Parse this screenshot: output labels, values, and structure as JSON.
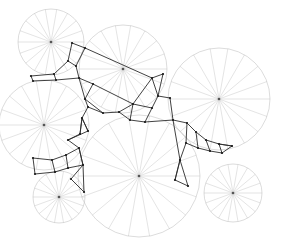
{
  "figure": {
    "width": 281,
    "height": 241,
    "background_color": "#ffffff",
    "circle_stroke_color": "#b9b9b9",
    "spoke_stroke_color": "#c2c2c2",
    "mesh_stroke_color": "#2b2b2b",
    "center_dot_color": "#555555",
    "spokes_per_circle": 18,
    "spoke_angle_step_degrees": 20
  },
  "chart_data": {
    "type": "scatter",
    "xlabel": "",
    "ylabel": "",
    "xlim": [
      0,
      281
    ],
    "ylim": [
      0,
      241
    ],
    "grid": false,
    "legend": "none",
    "circles": [
      {
        "name": "circle-top-left",
        "cx": 51,
        "cy": 42,
        "r": 33,
        "spokes": 18
      },
      {
        "name": "circle-top-middle",
        "cx": 123,
        "cy": 69,
        "r": 44,
        "spokes": 18
      },
      {
        "name": "circle-right",
        "cx": 219,
        "cy": 99,
        "r": 51,
        "spokes": 18
      },
      {
        "name": "circle-left",
        "cx": 44,
        "cy": 125,
        "r": 45,
        "spokes": 18
      },
      {
        "name": "circle-center-bottom",
        "cx": 139,
        "cy": 176,
        "r": 61,
        "spokes": 18
      },
      {
        "name": "circle-bottom-left",
        "cx": 59,
        "cy": 197,
        "r": 26,
        "spokes": 18
      },
      {
        "name": "circle-bottom-right",
        "cx": 233,
        "cy": 193,
        "r": 29,
        "spokes": 18
      }
    ],
    "mesh_nodes": [
      {
        "id": 0,
        "x": 31,
        "y": 76
      },
      {
        "id": 1,
        "x": 54,
        "y": 74
      },
      {
        "id": 2,
        "x": 33,
        "y": 81
      },
      {
        "id": 3,
        "x": 56,
        "y": 80
      },
      {
        "id": 4,
        "x": 72,
        "y": 43
      },
      {
        "id": 5,
        "x": 85,
        "y": 48
      },
      {
        "id": 6,
        "x": 76,
        "y": 66
      },
      {
        "id": 7,
        "x": 68,
        "y": 61
      },
      {
        "id": 8,
        "x": 79,
        "y": 78
      },
      {
        "id": 9,
        "x": 93,
        "y": 84
      },
      {
        "id": 10,
        "x": 85,
        "y": 99
      },
      {
        "id": 11,
        "x": 88,
        "y": 107
      },
      {
        "id": 12,
        "x": 82,
        "y": 118
      },
      {
        "id": 13,
        "x": 88,
        "y": 131
      },
      {
        "id": 14,
        "x": 103,
        "y": 113
      },
      {
        "id": 15,
        "x": 119,
        "y": 112
      },
      {
        "id": 16,
        "x": 133,
        "y": 104
      },
      {
        "id": 17,
        "x": 130,
        "y": 120
      },
      {
        "id": 18,
        "x": 145,
        "y": 122
      },
      {
        "id": 19,
        "x": 152,
        "y": 108
      },
      {
        "id": 20,
        "x": 152,
        "y": 78
      },
      {
        "id": 21,
        "x": 163,
        "y": 74
      },
      {
        "id": 22,
        "x": 158,
        "y": 96
      },
      {
        "id": 23,
        "x": 170,
        "y": 98
      },
      {
        "id": 24,
        "x": 173,
        "y": 120
      },
      {
        "id": 25,
        "x": 187,
        "y": 123
      },
      {
        "id": 26,
        "x": 196,
        "y": 132
      },
      {
        "id": 27,
        "x": 206,
        "y": 140
      },
      {
        "id": 28,
        "x": 219,
        "y": 144
      },
      {
        "id": 29,
        "x": 232,
        "y": 146
      },
      {
        "id": 30,
        "x": 186,
        "y": 143
      },
      {
        "id": 31,
        "x": 198,
        "y": 148
      },
      {
        "id": 32,
        "x": 210,
        "y": 151
      },
      {
        "id": 33,
        "x": 222,
        "y": 153
      },
      {
        "id": 34,
        "x": 180,
        "y": 160
      },
      {
        "id": 35,
        "x": 175,
        "y": 180
      },
      {
        "id": 36,
        "x": 188,
        "y": 186
      },
      {
        "id": 37,
        "x": 33,
        "y": 158
      },
      {
        "id": 38,
        "x": 35,
        "y": 174
      },
      {
        "id": 39,
        "x": 52,
        "y": 160
      },
      {
        "id": 40,
        "x": 55,
        "y": 172
      },
      {
        "id": 41,
        "x": 66,
        "y": 155
      },
      {
        "id": 42,
        "x": 68,
        "y": 168
      },
      {
        "id": 43,
        "x": 79,
        "y": 148
      },
      {
        "id": 44,
        "x": 83,
        "y": 165
      },
      {
        "id": 45,
        "x": 71,
        "y": 179
      },
      {
        "id": 46,
        "x": 84,
        "y": 192
      },
      {
        "id": 47,
        "x": 68,
        "y": 140
      },
      {
        "id": 48,
        "x": 80,
        "y": 134
      }
    ],
    "mesh_edges": [
      [
        0,
        1
      ],
      [
        0,
        2
      ],
      [
        1,
        3
      ],
      [
        2,
        3
      ],
      [
        1,
        7
      ],
      [
        3,
        8
      ],
      [
        4,
        5
      ],
      [
        4,
        7
      ],
      [
        5,
        6
      ],
      [
        6,
        7
      ],
      [
        6,
        8
      ],
      [
        5,
        20
      ],
      [
        8,
        9
      ],
      [
        9,
        10
      ],
      [
        8,
        10
      ],
      [
        10,
        11
      ],
      [
        11,
        12
      ],
      [
        12,
        13
      ],
      [
        11,
        14
      ],
      [
        14,
        15
      ],
      [
        15,
        16
      ],
      [
        16,
        17
      ],
      [
        15,
        17
      ],
      [
        17,
        18
      ],
      [
        18,
        19
      ],
      [
        19,
        16
      ],
      [
        16,
        20
      ],
      [
        20,
        21
      ],
      [
        21,
        22
      ],
      [
        20,
        22
      ],
      [
        22,
        19
      ],
      [
        22,
        23
      ],
      [
        23,
        24
      ],
      [
        24,
        18
      ],
      [
        24,
        25
      ],
      [
        25,
        26
      ],
      [
        26,
        27
      ],
      [
        27,
        28
      ],
      [
        28,
        29
      ],
      [
        25,
        30
      ],
      [
        30,
        31
      ],
      [
        31,
        32
      ],
      [
        32,
        33
      ],
      [
        26,
        31
      ],
      [
        27,
        32
      ],
      [
        28,
        33
      ],
      [
        29,
        33
      ],
      [
        30,
        34
      ],
      [
        34,
        24
      ],
      [
        34,
        35
      ],
      [
        35,
        36
      ],
      [
        36,
        34
      ],
      [
        13,
        47
      ],
      [
        47,
        48
      ],
      [
        48,
        12
      ],
      [
        47,
        43
      ],
      [
        43,
        41
      ],
      [
        41,
        39
      ],
      [
        39,
        37
      ],
      [
        37,
        38
      ],
      [
        38,
        40
      ],
      [
        40,
        42
      ],
      [
        42,
        44
      ],
      [
        44,
        43
      ],
      [
        39,
        40
      ],
      [
        41,
        42
      ],
      [
        43,
        44
      ],
      [
        44,
        45
      ],
      [
        45,
        46
      ],
      [
        46,
        44
      ],
      [
        13,
        12
      ],
      [
        9,
        16
      ],
      [
        10,
        14
      ],
      [
        12,
        48
      ],
      [
        35,
        34
      ],
      [
        29,
        28
      ]
    ]
  }
}
